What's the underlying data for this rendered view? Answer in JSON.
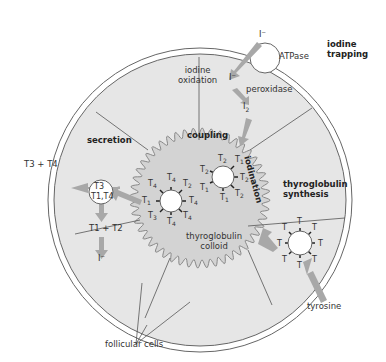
{
  "diagram": {
    "title_labels": {
      "iodine_trapping": "iodine\ntrapping",
      "atpase": "ATPase",
      "iodine_oxidation": "iodine\noxidation",
      "peroxidase": "peroxidase",
      "coupling": "coupling",
      "iodination": "iodination",
      "thyroglobulin_synthesis": "thyroglobulin\nsynthesis",
      "secretion": "secretion",
      "thyroglobulin_colloid": "thyroglobulin\ncolloid",
      "tyrosine": "tyrosine",
      "follicular_cells": "follicular cells"
    },
    "ions": {
      "iodide_outside": "I⁻",
      "iodide_inside": "I⁻",
      "iodine": "I",
      "iodine_sub": "2",
      "iodide_released": "I⁻"
    },
    "secretion": {
      "output_label": "T3 + T4",
      "vesicle_top": "T3",
      "vesicle_bottom": "T1,T4",
      "recycled": "T1 + T2"
    },
    "molecules": {
      "tyrosine_unit": "T",
      "coupled_labels": [
        "T4",
        "T2",
        "T4",
        "T1",
        "T4",
        "T4",
        "T4",
        "T3"
      ],
      "iodinated_labels": [
        "T2",
        "T1",
        "T2",
        "T2",
        "T1",
        "T1",
        "T2"
      ]
    },
    "colors": {
      "cell_fill": "#e6e6e6",
      "colloid_fill": "#d3d3d3",
      "arrow": "#a8a8a8",
      "line": "#555555"
    }
  }
}
